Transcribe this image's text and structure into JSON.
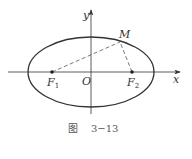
{
  "figure": {
    "caption_prefix": "图",
    "caption_number": "3−13"
  },
  "axes": {
    "x_label": "x",
    "y_label": "y",
    "origin_label": "O"
  },
  "points": {
    "f1": {
      "letter": "F",
      "sub": "1"
    },
    "f2": {
      "letter": "F",
      "sub": "2"
    },
    "m": {
      "letter": "M"
    }
  },
  "colors": {
    "stroke": "#333333",
    "dashed": "#555555",
    "caption": "#555555"
  }
}
